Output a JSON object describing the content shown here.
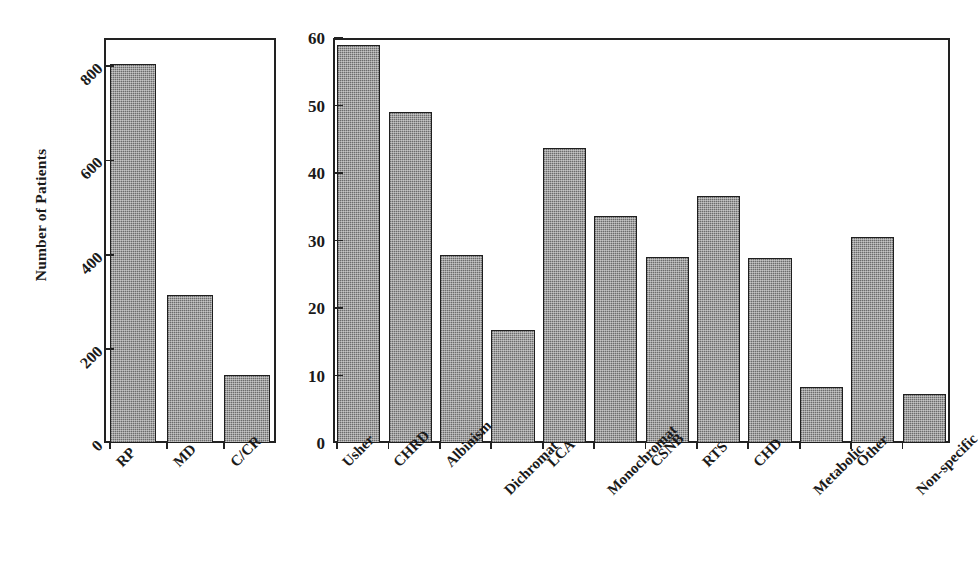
{
  "figure": {
    "background_color": "#ffffff",
    "bar_fill_color": "#8a8a8a",
    "bar_edge_color": "#1f1f1f",
    "axis_color": "#222222",
    "y_axis_title": "Number of Patients"
  },
  "chart_data": [
    {
      "type": "bar",
      "panel": "left",
      "title": "",
      "xlabel": "",
      "ylabel": "Number of Patients",
      "categories": [
        "RP",
        "MD",
        "C/CR"
      ],
      "values": [
        805,
        315,
        145
      ],
      "ylim": [
        0,
        860
      ],
      "yticks": [
        0,
        200,
        400,
        600,
        800
      ],
      "ytick_labels": [
        "0",
        "200",
        "400",
        "600",
        "800"
      ],
      "grid": false,
      "legend": null
    },
    {
      "type": "bar",
      "panel": "right",
      "title": "",
      "xlabel": "",
      "ylabel": "",
      "categories": [
        "Usher",
        "CHRD",
        "Albinism",
        "Dichromat",
        "LCA",
        "Monochromat",
        "CSNB",
        "RTS",
        "CHD",
        "Metabolic",
        "Other",
        "Non-specific"
      ],
      "values": [
        59,
        49,
        27.8,
        16.7,
        43.7,
        33.7,
        27.5,
        36.6,
        27.4,
        8.3,
        30.5,
        7.3
      ],
      "ylim": [
        0,
        60
      ],
      "yticks": [
        0,
        10,
        20,
        30,
        40,
        50,
        60
      ],
      "ytick_labels": [
        "0",
        "10",
        "20",
        "30",
        "40",
        "50",
        "60"
      ],
      "grid": false,
      "legend": null
    }
  ]
}
